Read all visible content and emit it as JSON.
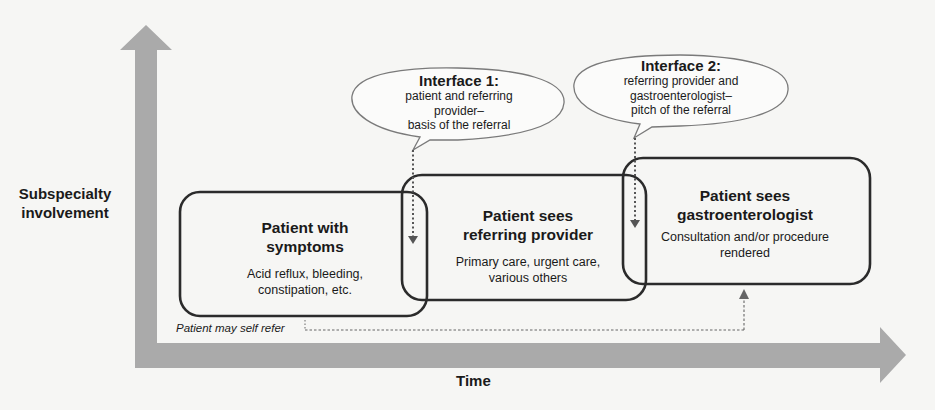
{
  "axes": {
    "y_label_line1": "Subspecialty",
    "y_label_line2": "involvement",
    "x_label": "Time",
    "arrow_color": "#aaaaaa"
  },
  "stages": [
    {
      "title_line1": "Patient with",
      "title_line2": "symptoms",
      "subtitle_line1": "Acid reflux, bleeding,",
      "subtitle_line2": "constipation, etc."
    },
    {
      "title_line1": "Patient sees",
      "title_line2": "referring provider",
      "subtitle_line1": "Primary care, urgent care,",
      "subtitle_line2": "various others"
    },
    {
      "title_line1": "Patient sees",
      "title_line2": "gastroenterologist",
      "subtitle_line1": "Consultation and/or procedure",
      "subtitle_line2": "rendered"
    }
  ],
  "interfaces": [
    {
      "title": "Interface 1:",
      "line1": "patient and referring",
      "line2": "provider–",
      "line3": "basis of the referral"
    },
    {
      "title": "Interface 2:",
      "line1": "referring provider and",
      "line2": "gastroenterologist–",
      "line3": "pitch of the referral"
    }
  ],
  "self_refer_label": "Patient may self refer",
  "colors": {
    "background": "#f6f6f4",
    "box_border": "#2b2b2b",
    "bubble_border": "#7a7a7a",
    "dotted": "#555555"
  }
}
